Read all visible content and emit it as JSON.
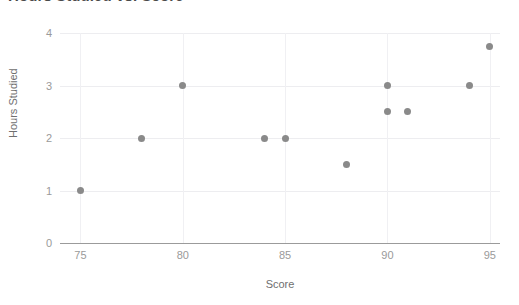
{
  "chart_data": {
    "type": "scatter",
    "title": "Hours Studied vs. Score",
    "xlabel": "Score",
    "ylabel": "Hours Studied",
    "xlim": [
      74,
      95.5
    ],
    "ylim": [
      0,
      4
    ],
    "xticks": [
      "75",
      "80",
      "85",
      "90",
      "95"
    ],
    "xtick_values": [
      75,
      80,
      85,
      90,
      95
    ],
    "yticks": [
      "0",
      "1",
      "2",
      "3",
      "4"
    ],
    "ytick_values": [
      0,
      1,
      2,
      3,
      4
    ],
    "grid": true,
    "legend": false,
    "marker_color": "#8a8a8a",
    "gridline_color": "#ededf0",
    "axis_color": "#9b9b9b",
    "background": "#ffffff",
    "x": [
      75,
      78,
      80,
      84,
      85,
      88,
      90,
      90,
      91,
      94,
      95
    ],
    "y": [
      1,
      2,
      3,
      2,
      2,
      1.5,
      3,
      2.5,
      2.5,
      3,
      3.75
    ],
    "points": [
      {
        "x": 75,
        "y": 1
      },
      {
        "x": 78,
        "y": 2
      },
      {
        "x": 80,
        "y": 3
      },
      {
        "x": 84,
        "y": 2
      },
      {
        "x": 85,
        "y": 2
      },
      {
        "x": 88,
        "y": 1.5
      },
      {
        "x": 90,
        "y": 3
      },
      {
        "x": 90,
        "y": 2.5
      },
      {
        "x": 91,
        "y": 2.5
      },
      {
        "x": 94,
        "y": 3
      },
      {
        "x": 95,
        "y": 3.75
      }
    ]
  }
}
